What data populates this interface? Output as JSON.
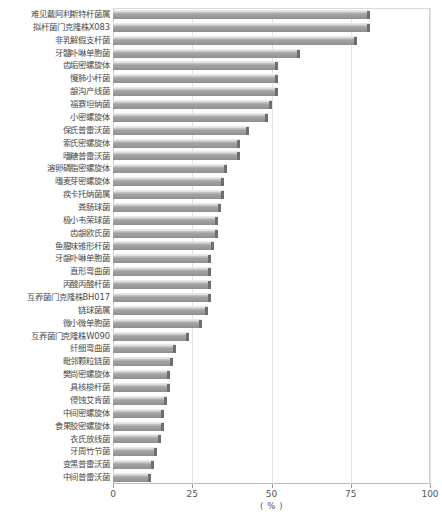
{
  "chart_data": {
    "type": "bar",
    "orientation": "horizontal",
    "title": "",
    "xlabel": "( % )",
    "ylabel": "",
    "xlim": [
      0,
      100
    ],
    "xticks": [
      0,
      25,
      50,
      75,
      100
    ],
    "xtick_labels": [
      "0",
      "25",
      "50",
      "75",
      "100"
    ],
    "grid": true,
    "legend": "none",
    "categories": [
      "难见戴阿利斯特杆菌属",
      "拟杆菌门克隆株X083",
      "非乳解假支杆菌",
      "牙髓卟啉单胞菌",
      "齿垢密螺旋体",
      "慢肺小杆菌",
      "龈沟产线菌",
      "福赛坦纳菌",
      "小密螺旋体",
      "保氏普雷沃菌",
      "索氏密螺旋体",
      "嗜糖普雷沃菌",
      "溶卵磷脂密螺旋体",
      "嗜麦芽密螺旋体",
      "疾卡托纳菌属",
      "粪肠球菌",
      "极小韦荣球菌",
      "齿龈欧氏菌",
      "鱼腥味锥形杆菌",
      "牙龈卟啉单胞菌",
      "直形弯曲菌",
      "丙酸丙酸杆菌",
      "互养菌门克隆株BH017",
      "链球菌属",
      "微小微单胞菌",
      "互养菌门克隆株W090",
      "纤细弯曲菌",
      "毗邻颗粒链菌",
      "樊尚密螺旋体",
      "具核梭杆菌",
      "侵蚀艾肯菌",
      "中间密螺旋体",
      "食果胶密螺旋体",
      "衣氏放线菌",
      "牙周竹节菌",
      "变黑普雷沃菌",
      "中间普雷沃菌"
    ],
    "values": [
      81,
      81,
      77,
      59,
      52,
      52,
      52,
      50,
      49,
      43,
      40,
      40,
      36,
      35,
      35,
      34,
      33,
      33,
      32,
      31,
      31,
      31,
      31,
      30,
      28,
      24,
      20,
      19,
      18,
      18,
      17,
      16,
      16,
      15,
      14,
      13,
      12
    ],
    "bar_color": "#9a9a9a",
    "bar_edge_color": "#6e6e6e",
    "grid_color": "#e2e2e2",
    "background_color": "#ffffff"
  }
}
